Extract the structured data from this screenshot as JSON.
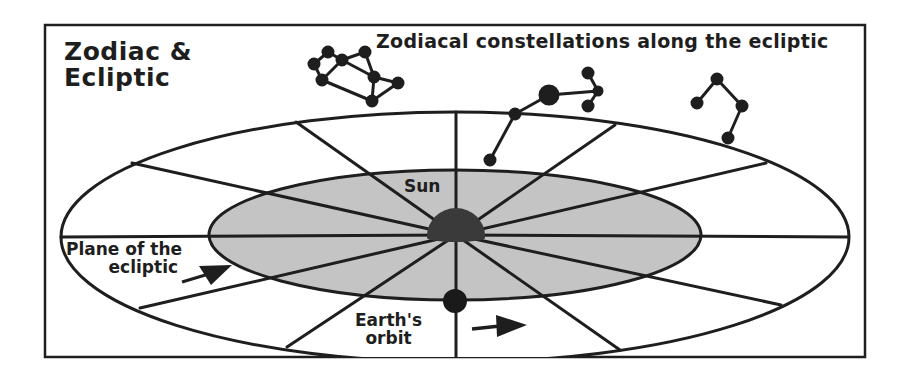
{
  "title": {
    "line1": "Zodiac &",
    "line2": "Ecliptic"
  },
  "caption": "Zodiacal constellations along the ecliptic",
  "labels": {
    "sun": "Sun",
    "plane_line1": "Plane of the",
    "plane_line2": "ecliptic",
    "earth_line1": "Earth's",
    "earth_line2": "orbit"
  },
  "colors": {
    "ink": "#1e1e1e",
    "inner_plane_fill": "#c4c4c4",
    "sun_fill": "#3a3a3a",
    "earth_fill": "#1a1a1a",
    "background": "#ffffff"
  },
  "geometry": {
    "frame": {
      "x": 45,
      "y": 25,
      "w": 820,
      "h": 332
    },
    "outer_ellipse": {
      "cx": 455,
      "cy": 237,
      "rx": 394,
      "ry": 125
    },
    "inner_ellipse": {
      "cx": 455,
      "cy": 235,
      "rx": 246,
      "ry": 65
    },
    "sun": {
      "cx": 456,
      "cy": 238,
      "r": 28
    },
    "earth": {
      "cx": 455,
      "cy": 301,
      "r": 12
    },
    "spoke_count": 12,
    "constellations": 3
  }
}
